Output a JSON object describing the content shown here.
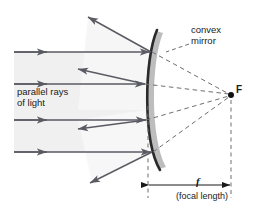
{
  "diagram": {
    "labels": {
      "mirror": "convex\nmirror",
      "rays": "parallel rays\nof light",
      "focal_point": "F",
      "focal_symbol": "f",
      "focal_caption": "(focal length)"
    },
    "colors": {
      "ray": "#5a5a63",
      "mirror_line": "#2b2b2b",
      "mirror_band": "#b9b9b9",
      "beam_fill": "#f0f0f0",
      "beam_wedge": "#f6f6f6",
      "dashed": "#6e6e6e",
      "text": "#1a1a1a",
      "background": "#ffffff"
    },
    "geometry": {
      "mirror_vertex_x": 148,
      "mirror_top": [
        157,
        30
      ],
      "mirror_bottom": [
        160,
        170
      ],
      "focal_point": [
        231,
        95
      ],
      "dimension_y": 185,
      "incoming_ray_y": [
        52,
        84,
        120,
        152
      ]
    },
    "elements": {
      "incoming_rays_count": 4,
      "reflected_rays_count": 4,
      "dashed_extension_count": 4
    }
  }
}
